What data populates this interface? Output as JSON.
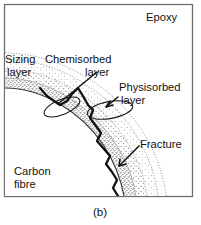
{
  "figure": {
    "caption": "(b)",
    "title_region": "fibre-matrix interphase schematic",
    "labels": [
      {
        "id": "epoxy",
        "text": "Epoxy",
        "lines": [
          "Epoxy"
        ],
        "x": 146,
        "y": 20
      },
      {
        "id": "sizing",
        "text": "Sizing layer",
        "lines": [
          "Sizing",
          "layer"
        ],
        "x": 5,
        "y": 62
      },
      {
        "id": "chemisorbed",
        "text": "Chemisorbed layer",
        "lines": [
          "Chemisorbed",
          "layer"
        ],
        "x": 44,
        "y": 62
      },
      {
        "id": "physisorbed",
        "text": "Physisorbed layer",
        "lines": [
          "Physisorbed",
          "layer"
        ],
        "x": 120,
        "y": 90
      },
      {
        "id": "fracture",
        "text": "Fracture",
        "lines": [
          "Fracture"
        ],
        "x": 140,
        "y": 144
      },
      {
        "id": "carbon-fibre",
        "text": "Carbon fibre",
        "lines": [
          "Carbon",
          "fibre"
        ],
        "x": 14,
        "y": 172
      }
    ],
    "label_text": {
      "epoxy": "Epoxy",
      "sizing_line1": "Sizing",
      "sizing_line2": "layer",
      "chemisorbed_line1": "Chemisorbed",
      "chemisorbed_line2": "layer",
      "physisorbed_line1": "Physisorbed",
      "physisorbed_line2": "layer",
      "fracture": "Fracture",
      "carbon_line1": "Carbon",
      "carbon_line2": "fibre"
    },
    "colors": {
      "frame_stroke": "#6e6e6e",
      "background": "#ffffff",
      "ink": "#111111",
      "stipple": "#555555",
      "soft_line": "#9a9a9a",
      "crack": "#111111"
    },
    "regions": [
      {
        "name": "carbon-fibre-core",
        "fill": "white"
      },
      {
        "name": "sizing-layer-band",
        "fill": "stipple-dense"
      },
      {
        "name": "chemisorbed-band",
        "fill": "stipple-medium"
      },
      {
        "name": "physisorbed-band",
        "fill": "stipple-light"
      },
      {
        "name": "epoxy-matrix",
        "fill": "white"
      }
    ],
    "annotations": [
      {
        "name": "chemisorbed-callout-ellipse",
        "cx": 62,
        "cy": 107,
        "rx": 19,
        "ry": 7.5,
        "rot": -22
      },
      {
        "name": "physisorbed-callout-ellipse",
        "cx": 110,
        "cy": 110,
        "rx": 23,
        "ry": 8.5,
        "rot": -10
      },
      {
        "name": "chemisorbed-leader",
        "from": [
          96,
          73
        ],
        "to": [
          58,
          104
        ]
      },
      {
        "name": "physisorbed-leader",
        "from": [
          117,
          98
        ],
        "to": [
          106,
          107
        ]
      },
      {
        "name": "fracture-leader",
        "from": [
          137,
          147
        ],
        "to": [
          120,
          165
        ]
      }
    ]
  }
}
